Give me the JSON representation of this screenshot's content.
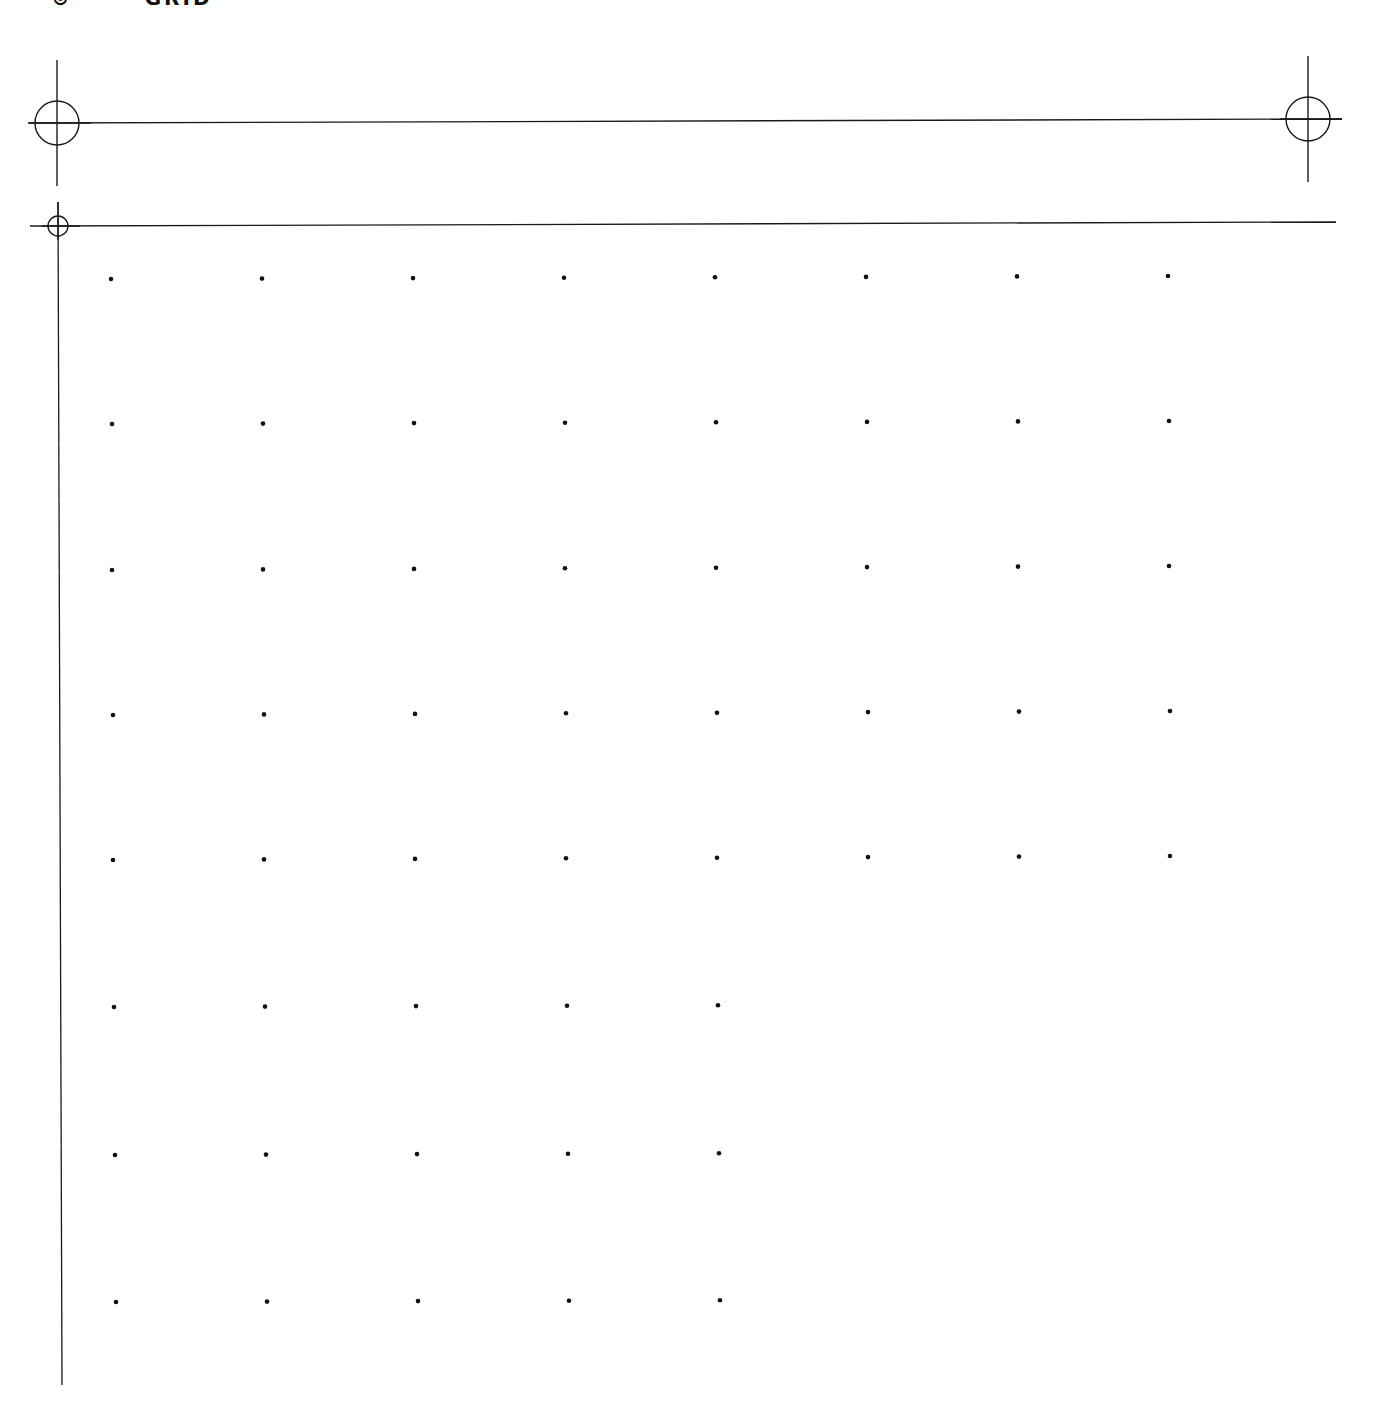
{
  "header": {
    "title": "⊙ ····· GRID",
    "clipped": true
  },
  "colors": {
    "background": "#ffffff",
    "ink": "#1a1a1a",
    "dot": "#111111"
  },
  "registration_marks": [
    {
      "id": "top-left",
      "cx": 57,
      "cy": 123,
      "r": 22,
      "v_top": 60,
      "v_bottom": 186
    },
    {
      "id": "top-right",
      "cx": 1308,
      "cy": 119,
      "r": 22,
      "v_top": 56,
      "v_bottom": 182
    },
    {
      "id": "grid-origin",
      "cx": 58,
      "cy": 226,
      "r": 10,
      "v_top": 202,
      "v_bottom": 1385
    }
  ],
  "lines": {
    "top_rule": {
      "x1": 28,
      "y1": 123,
      "x2": 1342,
      "y2": 119
    },
    "grid_top_rule": {
      "x1": 30,
      "y1": 226,
      "x2": 1336,
      "y2": 222
    },
    "grid_left_rule": {
      "x1": 58,
      "y1": 202,
      "x2": 62,
      "y2": 1385
    }
  },
  "dot_grid": {
    "column_spacing": 151,
    "rows": [
      {
        "y_start": 279,
        "y_end": 276,
        "x_start": 111,
        "count": 8
      },
      {
        "y_start": 424,
        "y_end": 421,
        "x_start": 112,
        "count": 8
      },
      {
        "y_start": 570,
        "y_end": 566,
        "x_start": 112,
        "count": 8
      },
      {
        "y_start": 715,
        "y_end": 711,
        "x_start": 113,
        "count": 8
      },
      {
        "y_start": 860,
        "y_end": 856,
        "x_start": 113,
        "count": 8
      },
      {
        "y_start": 1007,
        "y_end": 1004,
        "x_start": 114,
        "count": 5
      },
      {
        "y_start": 1155,
        "y_end": 1152,
        "x_start": 115,
        "count": 5
      },
      {
        "y_start": 1302,
        "y_end": 1299,
        "x_start": 116,
        "count": 5
      }
    ],
    "dot_radius": 2.3
  }
}
